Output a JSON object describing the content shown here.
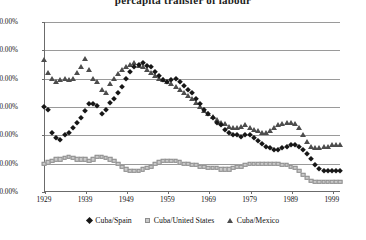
{
  "chart_data": {
    "type": "scatter",
    "title": "percapita transfer of labour",
    "xlabel": "",
    "ylabel": "",
    "xlim": [
      1929,
      2001
    ],
    "ylim": [
      0,
      1.2
    ],
    "grid": true,
    "legend_position": "bottom",
    "y_tick_labels": [
      "0.00%",
      "20.00%",
      "40.00%",
      "60.00%",
      "80.00%",
      "100.00%",
      "120.00%"
    ],
    "y_tick_values": [
      0,
      0.2,
      0.4,
      0.6,
      0.8,
      1.0,
      1.2
    ],
    "x_tick_labels": [
      "1929",
      "1939",
      "1949",
      "1959",
      "1969",
      "1979",
      "1989",
      "1999"
    ],
    "x_tick_values": [
      1929,
      1939,
      1949,
      1959,
      1969,
      1979,
      1989,
      1999
    ],
    "x": [
      1929,
      1930,
      1931,
      1932,
      1933,
      1934,
      1935,
      1936,
      1937,
      1938,
      1939,
      1940,
      1941,
      1942,
      1943,
      1944,
      1945,
      1946,
      1947,
      1948,
      1949,
      1950,
      1951,
      1952,
      1953,
      1954,
      1955,
      1956,
      1957,
      1958,
      1959,
      1960,
      1961,
      1962,
      1963,
      1964,
      1965,
      1966,
      1967,
      1968,
      1969,
      1970,
      1971,
      1972,
      1973,
      1974,
      1975,
      1976,
      1977,
      1978,
      1979,
      1980,
      1981,
      1982,
      1983,
      1984,
      1985,
      1986,
      1987,
      1988,
      1989,
      1990,
      1991,
      1992,
      1993,
      1994,
      1995,
      1996,
      1997,
      1998,
      1999,
      2000,
      2001
    ],
    "series": [
      {
        "name": "Cuba/Spain",
        "marker": "diamond",
        "color": "#171717",
        "values": [
          0.6,
          0.58,
          0.42,
          0.38,
          0.37,
          0.4,
          0.42,
          0.45,
          0.49,
          0.52,
          0.57,
          0.62,
          0.62,
          0.61,
          0.55,
          0.58,
          0.63,
          0.66,
          0.7,
          0.74,
          0.8,
          0.85,
          0.88,
          0.9,
          0.91,
          0.89,
          0.88,
          0.85,
          0.82,
          0.79,
          0.78,
          0.79,
          0.8,
          0.78,
          0.75,
          0.72,
          0.7,
          0.66,
          0.62,
          0.58,
          0.55,
          0.52,
          0.49,
          0.47,
          0.44,
          0.42,
          0.4,
          0.4,
          0.39,
          0.4,
          0.4,
          0.38,
          0.36,
          0.34,
          0.32,
          0.31,
          0.3,
          0.3,
          0.31,
          0.32,
          0.33,
          0.33,
          0.32,
          0.3,
          0.27,
          0.23,
          0.19,
          0.16,
          0.15,
          0.15,
          0.15,
          0.15,
          0.15
        ]
      },
      {
        "name": "Cuba/United States",
        "marker": "square",
        "color": "#c9c9c9",
        "values": [
          0.2,
          0.21,
          0.22,
          0.23,
          0.23,
          0.24,
          0.25,
          0.24,
          0.23,
          0.23,
          0.23,
          0.22,
          0.23,
          0.25,
          0.25,
          0.24,
          0.23,
          0.22,
          0.2,
          0.18,
          0.16,
          0.15,
          0.15,
          0.15,
          0.16,
          0.17,
          0.18,
          0.2,
          0.21,
          0.22,
          0.22,
          0.22,
          0.22,
          0.21,
          0.2,
          0.2,
          0.19,
          0.19,
          0.18,
          0.18,
          0.17,
          0.17,
          0.17,
          0.16,
          0.16,
          0.16,
          0.17,
          0.18,
          0.18,
          0.19,
          0.2,
          0.2,
          0.2,
          0.2,
          0.2,
          0.2,
          0.2,
          0.2,
          0.19,
          0.19,
          0.18,
          0.17,
          0.15,
          0.12,
          0.1,
          0.08,
          0.07,
          0.07,
          0.07,
          0.07,
          0.07,
          0.07,
          0.07
        ]
      },
      {
        "name": "Cuba/Mexico",
        "marker": "triangle",
        "color": "#4d4d4d",
        "values": [
          0.93,
          0.84,
          0.8,
          0.78,
          0.79,
          0.8,
          0.79,
          0.8,
          0.84,
          0.88,
          0.94,
          0.86,
          0.8,
          0.78,
          0.72,
          0.7,
          0.76,
          0.8,
          0.83,
          0.86,
          0.88,
          0.9,
          0.91,
          0.89,
          0.88,
          0.86,
          0.84,
          0.82,
          0.8,
          0.79,
          0.78,
          0.76,
          0.74,
          0.72,
          0.7,
          0.68,
          0.66,
          0.63,
          0.6,
          0.57,
          0.55,
          0.53,
          0.51,
          0.49,
          0.48,
          0.46,
          0.45,
          0.45,
          0.46,
          0.47,
          0.45,
          0.44,
          0.43,
          0.42,
          0.42,
          0.43,
          0.45,
          0.47,
          0.48,
          0.49,
          0.49,
          0.48,
          0.45,
          0.4,
          0.35,
          0.32,
          0.31,
          0.31,
          0.32,
          0.32,
          0.33,
          0.33,
          0.33
        ]
      }
    ]
  }
}
